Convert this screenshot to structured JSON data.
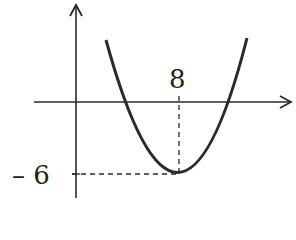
{
  "diagram": {
    "type": "parabola-graph",
    "labels": {
      "x_vertex": "8",
      "y_vertex": "– 6"
    },
    "vertex": {
      "x": 8,
      "y": -6
    },
    "colors": {
      "stroke": "#2a2a2a",
      "background": "#ffffff"
    }
  }
}
